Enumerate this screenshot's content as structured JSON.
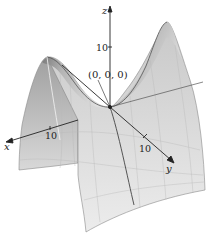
{
  "figure": {
    "axes": {
      "x": {
        "label": "x",
        "tick": "10"
      },
      "y": {
        "label": "y",
        "tick": "10"
      },
      "z": {
        "label": "z",
        "tick": "10"
      }
    },
    "origin_label": "(0, 0, 0)",
    "colors": {
      "background": "#ffffff",
      "surface_dark": "#5a5a5a",
      "surface_light": "#e8e8e8",
      "axis": "#222222"
    }
  }
}
